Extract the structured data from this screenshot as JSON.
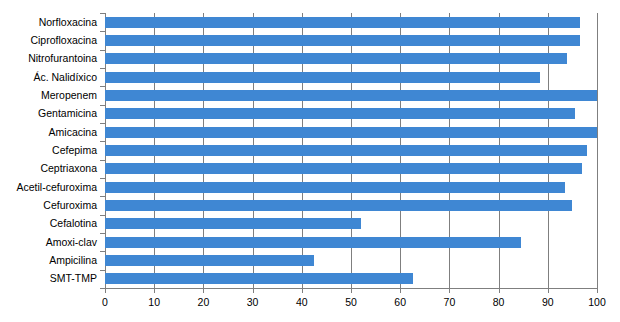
{
  "chart_data": {
    "type": "bar",
    "orientation": "horizontal",
    "title": "",
    "subtitle": "",
    "xlabel": "",
    "ylabel": "",
    "xlim": [
      0,
      100
    ],
    "xticks": [
      "0",
      "10",
      "20",
      "30",
      "40",
      "50",
      "60",
      "70",
      "80",
      "90",
      "100"
    ],
    "xtick_values": [
      0,
      10,
      20,
      30,
      40,
      50,
      60,
      70,
      80,
      90,
      100
    ],
    "grid": "vertical",
    "legend": "none",
    "bar_color": "#3f87d3",
    "axis_color": "#7f7f7f",
    "categories": [
      "Norfloxacina",
      "Ciprofloxacina",
      "Nitrofurantoina",
      "Ác. Nalidíxico",
      "Meropenem",
      "Gentamicina",
      "Amicacina",
      "Cefepima",
      "Ceptriaxona",
      "Acetil-cefuroxima",
      "Cefuroxima",
      "Cefalotina",
      "Amoxi-clav",
      "Ampicilina",
      "SMT-TMP"
    ],
    "values": [
      96.5,
      96.5,
      94,
      88.5,
      100,
      95.5,
      100,
      98,
      97,
      93.5,
      95,
      52,
      84.5,
      42.5,
      62.5
    ]
  }
}
